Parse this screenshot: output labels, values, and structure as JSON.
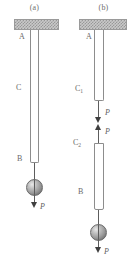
{
  "figure": {
    "panels": [
      {
        "caption": "(a)",
        "labels": {
          "support_point": "A",
          "rod": "C",
          "lower_point": "B",
          "load": "P"
        },
        "elements": {
          "ceiling": "hatched-fixed-support",
          "rod_type": "single-uniform-tube",
          "weight": "sphere",
          "load_direction": "down"
        }
      },
      {
        "caption": "(b)",
        "labels": {
          "support_point": "A",
          "rod_upper": "C",
          "rod_upper_sub": "1",
          "rod_lower": "C",
          "rod_lower_sub": "2",
          "lower_point": "B",
          "internal_force_down": "P",
          "internal_force_up": "P",
          "load": "P"
        },
        "elements": {
          "ceiling": "hatched-fixed-support",
          "rod_type": "two-segment-tube-with-cut",
          "weight": "sphere",
          "load_direction": "down",
          "internal_pair": "opposing-arrows"
        }
      }
    ]
  },
  "colors": {
    "ceiling_fill": "#c9c9c9",
    "ceiling_hatch": "#787878",
    "outline": "#8d8d8d",
    "arrow": "#3f3f3f",
    "text": "#6a6a6a",
    "sphere_light": "#e8e8e8",
    "sphere_dark": "#585858"
  }
}
